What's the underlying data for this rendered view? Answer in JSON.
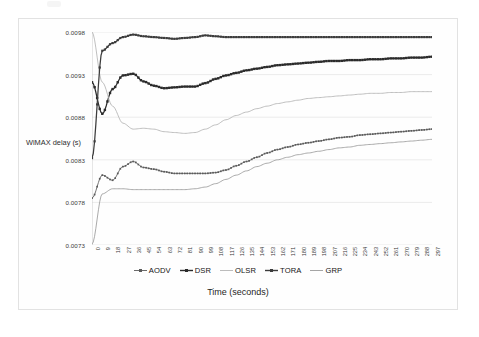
{
  "figure": {
    "y_axis_title": "WiMAX delay (s)",
    "x_axis_title": "Time (seconds)"
  },
  "chart_data": {
    "type": "line",
    "title": "",
    "xlabel": "Time (seconds)",
    "ylabel": "WiMAX delay (s)",
    "xlim": [
      0,
      297
    ],
    "ylim": [
      0.0073,
      0.0098
    ],
    "grid": true,
    "legend_position": "bottom",
    "y_ticks": [
      "0.0073",
      "0.0078",
      "0.0083",
      "0.0088",
      "0.0093",
      "0.0098"
    ],
    "x_ticks": [
      "0",
      "9",
      "18",
      "27",
      "36",
      "45",
      "54",
      "63",
      "72",
      "81",
      "90",
      "99",
      "108",
      "117",
      "126",
      "135",
      "144",
      "153",
      "162",
      "171",
      "180",
      "189",
      "198",
      "207",
      "216",
      "225",
      "234",
      "243",
      "252",
      "261",
      "270",
      "279",
      "288",
      "297"
    ],
    "x": [
      0,
      9,
      18,
      27,
      36,
      45,
      54,
      63,
      72,
      81,
      90,
      99,
      108,
      117,
      126,
      135,
      144,
      153,
      162,
      171,
      180,
      189,
      198,
      207,
      216,
      225,
      234,
      243,
      252,
      261,
      270,
      279,
      288,
      297
    ],
    "series": [
      {
        "name": "AODV",
        "color": "#5a5a5a",
        "marker": "cross",
        "values": [
          0.00785,
          0.00812,
          0.00806,
          0.00822,
          0.00828,
          0.00821,
          0.00819,
          0.00816,
          0.00814,
          0.00814,
          0.00814,
          0.00814,
          0.00815,
          0.00818,
          0.00823,
          0.00828,
          0.00833,
          0.00838,
          0.00842,
          0.00845,
          0.00848,
          0.0085,
          0.00852,
          0.00854,
          0.00856,
          0.00857,
          0.00859,
          0.0086,
          0.00861,
          0.00862,
          0.00863,
          0.00864,
          0.00865,
          0.00866
        ]
      },
      {
        "name": "DSR",
        "color": "#2b2b2b",
        "marker": "square",
        "values": [
          0.00921,
          0.00884,
          0.00913,
          0.00929,
          0.00931,
          0.00922,
          0.00917,
          0.00914,
          0.00915,
          0.00916,
          0.00916,
          0.0092,
          0.00925,
          0.00929,
          0.00932,
          0.00935,
          0.00937,
          0.00939,
          0.00941,
          0.00942,
          0.00943,
          0.00944,
          0.00945,
          0.00946,
          0.00946,
          0.00947,
          0.00947,
          0.00948,
          0.00948,
          0.00949,
          0.00949,
          0.0095,
          0.0095,
          0.00951
        ]
      },
      {
        "name": "OLSR",
        "color": "#b4b4b4",
        "marker": "none",
        "values": [
          0.0098,
          0.00921,
          0.00893,
          0.00873,
          0.00866,
          0.00867,
          0.00866,
          0.00863,
          0.00862,
          0.00861,
          0.00862,
          0.00866,
          0.00871,
          0.00877,
          0.00882,
          0.00886,
          0.0089,
          0.00893,
          0.00896,
          0.00898,
          0.009,
          0.00902,
          0.00903,
          0.00904,
          0.00905,
          0.00906,
          0.00907,
          0.00908,
          0.00908,
          0.00909,
          0.00909,
          0.0091,
          0.0091,
          0.0091
        ]
      },
      {
        "name": "TORA",
        "color": "#3c3c3c",
        "marker": "square-small",
        "values": [
          0.00832,
          0.00958,
          0.00967,
          0.00974,
          0.00977,
          0.00975,
          0.00974,
          0.00973,
          0.00972,
          0.00973,
          0.00974,
          0.00976,
          0.00975,
          0.00974,
          0.00974,
          0.00974,
          0.00974,
          0.00974,
          0.00974,
          0.00974,
          0.00974,
          0.00974,
          0.00974,
          0.00974,
          0.00974,
          0.00974,
          0.00974,
          0.00974,
          0.00974,
          0.00974,
          0.00974,
          0.00974,
          0.00974,
          0.00974
        ]
      },
      {
        "name": "GRP",
        "color": "#9b9b9b",
        "marker": "none",
        "values": [
          0.00731,
          0.0079,
          0.00796,
          0.00796,
          0.00795,
          0.00795,
          0.00795,
          0.00795,
          0.00795,
          0.00795,
          0.00796,
          0.00798,
          0.00802,
          0.00807,
          0.00812,
          0.00817,
          0.00822,
          0.00826,
          0.0083,
          0.00833,
          0.00836,
          0.00838,
          0.0084,
          0.00842,
          0.00844,
          0.00845,
          0.00847,
          0.00848,
          0.00849,
          0.0085,
          0.00851,
          0.00852,
          0.00853,
          0.00854
        ]
      }
    ]
  },
  "legend": {
    "items": [
      {
        "label": "AODV",
        "color": "#5a5a5a"
      },
      {
        "label": "DSR",
        "color": "#2b2b2b"
      },
      {
        "label": "OLSR",
        "color": "#b4b4b4"
      },
      {
        "label": "TORA",
        "color": "#3c3c3c"
      },
      {
        "label": "GRP",
        "color": "#9b9b9b"
      }
    ]
  }
}
